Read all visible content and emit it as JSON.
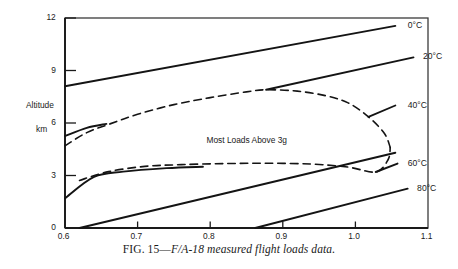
{
  "figure": {
    "caption_prefix": "FIG. 15—",
    "caption_italic": "F/A-18 measured flight loads data."
  },
  "chart_data": {
    "type": "line",
    "title": "",
    "xlabel": "",
    "ylabel": "Altitude",
    "ylabel_unit": "km",
    "xlim": [
      0.6,
      1.1
    ],
    "ylim": [
      0,
      12
    ],
    "grid": false,
    "legend_position": "inline-right-labels",
    "x_ticks": [
      "0.6",
      "0.7",
      "0.8",
      "0.9",
      "1.0",
      "1.1"
    ],
    "x_tick_values": [
      0.6,
      0.7,
      0.8,
      0.9,
      1.0,
      1.1
    ],
    "y_ticks": [
      "0",
      "3",
      "6",
      "9",
      "12"
    ],
    "y_tick_values": [
      0,
      3,
      6,
      9,
      12
    ],
    "annotations": [
      {
        "text": "Most Loads Above 3g",
        "x": 0.855,
        "y": 5.05
      }
    ],
    "series": [
      {
        "name": "0°C",
        "label": "0°C",
        "style": "solid",
        "points": [
          [
            0.6,
            8.1
          ],
          [
            1.055,
            11.55
          ]
        ]
      },
      {
        "name": "20°C",
        "label": "20°C",
        "style": "solid",
        "points": [
          [
            0.877,
            7.9
          ],
          [
            1.08,
            9.75
          ]
        ]
      },
      {
        "name": "40°C",
        "label": "40°C",
        "style": "solid",
        "points": [
          [
            1.018,
            6.35
          ],
          [
            1.055,
            7.0
          ]
        ]
      },
      {
        "name": "60°C",
        "label": "60°C",
        "style": "solid",
        "points": [
          [
            0.62,
            0.0
          ],
          [
            1.055,
            4.3
          ]
        ]
      },
      {
        "name": "60°C-tick",
        "label": "",
        "style": "solid",
        "points": [
          [
            1.028,
            3.2
          ],
          [
            1.058,
            3.68
          ]
        ]
      },
      {
        "name": "80°C",
        "label": "80°C",
        "style": "solid",
        "points": [
          [
            0.862,
            0.0
          ],
          [
            1.072,
            2.25
          ]
        ]
      },
      {
        "name": "lower-solid-branch",
        "label": "",
        "style": "solid",
        "points": [
          [
            0.6,
            1.7
          ],
          [
            0.64,
            2.92
          ],
          [
            0.68,
            3.22
          ],
          [
            0.74,
            3.42
          ],
          [
            0.79,
            3.5
          ]
        ]
      },
      {
        "name": "upper-solid-branch",
        "label": "",
        "style": "solid",
        "points": [
          [
            0.6,
            5.25
          ],
          [
            0.63,
            5.72
          ],
          [
            0.657,
            5.95
          ]
        ]
      },
      {
        "name": "upper-envelope",
        "label": "",
        "style": "dashed",
        "points": [
          [
            0.6,
            4.7
          ],
          [
            0.63,
            5.45
          ],
          [
            0.662,
            5.95
          ],
          [
            0.7,
            6.5
          ],
          [
            0.75,
            7.05
          ],
          [
            0.8,
            7.45
          ],
          [
            0.85,
            7.78
          ],
          [
            0.877,
            7.9
          ],
          [
            0.92,
            7.82
          ],
          [
            0.96,
            7.55
          ],
          [
            0.99,
            7.15
          ],
          [
            1.018,
            6.35
          ],
          [
            1.04,
            5.4
          ],
          [
            1.048,
            4.6
          ]
        ]
      },
      {
        "name": "lower-envelope",
        "label": "",
        "style": "dashed",
        "points": [
          [
            0.62,
            2.72
          ],
          [
            0.66,
            3.22
          ],
          [
            0.71,
            3.52
          ],
          [
            0.76,
            3.62
          ],
          [
            0.82,
            3.68
          ],
          [
            0.88,
            3.7
          ],
          [
            0.94,
            3.65
          ],
          [
            0.99,
            3.48
          ],
          [
            1.028,
            3.2
          ],
          [
            1.045,
            3.9
          ],
          [
            1.048,
            4.6
          ]
        ]
      }
    ],
    "series_labels": [
      {
        "text": "0°C",
        "x": 1.072,
        "y": 11.62
      },
      {
        "text": "20°C",
        "x": 1.093,
        "y": 9.82
      },
      {
        "text": "40°C",
        "x": 1.072,
        "y": 7.05
      },
      {
        "text": "60°C",
        "x": 1.072,
        "y": 3.73
      },
      {
        "text": "80°C",
        "x": 1.085,
        "y": 2.3
      }
    ]
  }
}
